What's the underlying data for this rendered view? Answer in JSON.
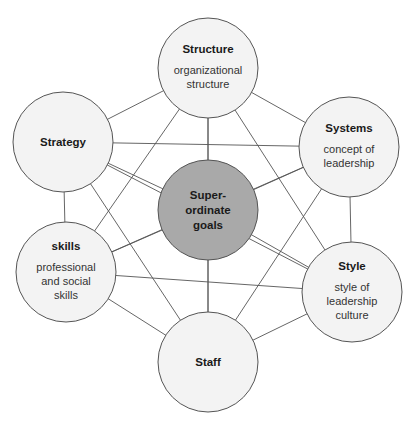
{
  "diagram": {
    "colors": {
      "line": "#555555",
      "outer_fill": "#f3f3f3",
      "center_fill": "#a9a9a9",
      "stroke": "#555555"
    },
    "radius": 50,
    "center": {
      "id": "center",
      "x": 208,
      "y": 210,
      "lines": [
        "Super-",
        "ordinate",
        "goals"
      ]
    },
    "nodes": [
      {
        "id": "structure",
        "x": 208,
        "y": 68,
        "title": "Structure",
        "sub": [
          "organizational",
          "structure"
        ]
      },
      {
        "id": "systems",
        "x": 349,
        "y": 147,
        "title": "Systems",
        "sub": [
          "concept of",
          "leadership"
        ]
      },
      {
        "id": "style",
        "x": 352,
        "y": 292,
        "title": "Style",
        "sub": [
          "style of",
          "leadership",
          "culture"
        ]
      },
      {
        "id": "staff",
        "x": 208,
        "y": 362,
        "title": "Staff",
        "sub": []
      },
      {
        "id": "skills",
        "x": 66,
        "y": 272,
        "title": "skills",
        "sub": [
          "professional",
          "and social",
          "skills"
        ]
      },
      {
        "id": "strategy",
        "x": 63,
        "y": 142,
        "title": "Strategy",
        "sub": []
      }
    ]
  }
}
